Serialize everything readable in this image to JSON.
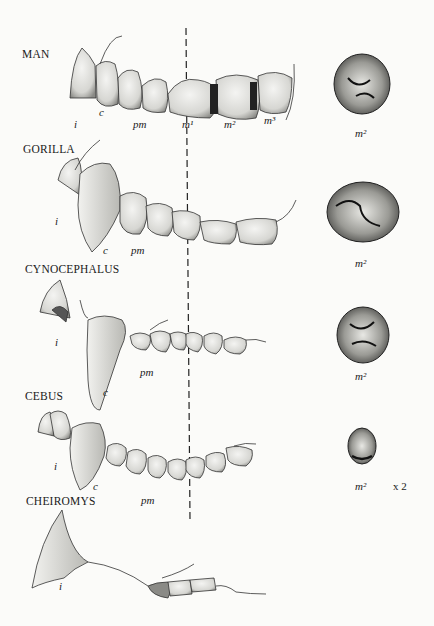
{
  "figure": {
    "type": "comparative dentition illustration",
    "rows": [
      {
        "species": "MAN",
        "labels": [
          "i",
          "c",
          "pm",
          "m¹",
          "m²",
          "m³"
        ],
        "detail_label": "m²"
      },
      {
        "species": "GORILLA",
        "labels": [
          "i",
          "c",
          "pm"
        ],
        "detail_label": "m²"
      },
      {
        "species": "CYNOCEPHALUS",
        "labels": [
          "i",
          "c",
          "pm"
        ],
        "detail_label": "m²"
      },
      {
        "species": "CEBUS",
        "labels": [
          "i",
          "c",
          "pm"
        ],
        "detail_label": "m²",
        "scale_note": "x 2"
      },
      {
        "species": "CHEIROMYS",
        "labels": [
          "i"
        ]
      }
    ],
    "reference_line": "dashed vertical line"
  }
}
